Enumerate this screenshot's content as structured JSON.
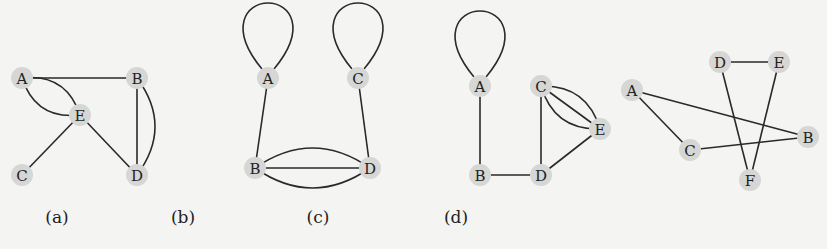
{
  "figure": {
    "panels": [
      {
        "id": "a",
        "caption": "(a)",
        "caption_pos": [
          57,
          217
        ],
        "nodes": [
          {
            "label": "A",
            "x": 22,
            "y": 78
          },
          {
            "label": "B",
            "x": 137,
            "y": 78
          },
          {
            "label": "E",
            "x": 80,
            "y": 115
          },
          {
            "label": "C",
            "x": 22,
            "y": 175
          },
          {
            "label": "D",
            "x": 137,
            "y": 175
          }
        ],
        "edges": [
          {
            "from": "A",
            "to": "B",
            "curve": 0
          },
          {
            "from": "A",
            "to": "E",
            "curve": 14
          },
          {
            "from": "A",
            "to": "E",
            "curve": -14
          },
          {
            "from": "B",
            "to": "D",
            "curve": 0
          },
          {
            "from": "B",
            "to": "D",
            "curve": -18
          },
          {
            "from": "E",
            "to": "C",
            "curve": 0
          },
          {
            "from": "E",
            "to": "D",
            "curve": 0
          }
        ]
      },
      {
        "id": "b",
        "caption": "(b)",
        "caption_pos": [
          183,
          217
        ],
        "nodes": [
          {
            "label": "A",
            "x": 268,
            "y": 78
          },
          {
            "label": "C",
            "x": 358,
            "y": 78
          },
          {
            "label": "B",
            "x": 255,
            "y": 168
          },
          {
            "label": "D",
            "x": 370,
            "y": 168
          }
        ],
        "edges": [
          {
            "from": "A",
            "to": "A",
            "loop": true
          },
          {
            "from": "C",
            "to": "C",
            "loop": true
          },
          {
            "from": "A",
            "to": "B",
            "curve": 0
          },
          {
            "from": "C",
            "to": "D",
            "curve": 0
          },
          {
            "from": "B",
            "to": "D",
            "curve": 0
          },
          {
            "from": "B",
            "to": "D",
            "curve": 20
          },
          {
            "from": "B",
            "to": "D",
            "curve": -20
          }
        ]
      },
      {
        "id": "c",
        "caption": "(c)",
        "caption_pos": [
          318,
          217
        ],
        "nodes": [
          {
            "label": "A",
            "x": 480,
            "y": 86
          },
          {
            "label": "C",
            "x": 541,
            "y": 86
          },
          {
            "label": "E",
            "x": 600,
            "y": 129
          },
          {
            "label": "B",
            "x": 480,
            "y": 175
          },
          {
            "label": "D",
            "x": 541,
            "y": 175
          }
        ],
        "edges": [
          {
            "from": "A",
            "to": "A",
            "loop": true
          },
          {
            "from": "A",
            "to": "B",
            "curve": 0
          },
          {
            "from": "B",
            "to": "D",
            "curve": 0
          },
          {
            "from": "C",
            "to": "D",
            "curve": 0
          },
          {
            "from": "D",
            "to": "E",
            "curve": 0
          },
          {
            "from": "C",
            "to": "E",
            "curve": 0
          },
          {
            "from": "C",
            "to": "E",
            "curve": 14
          },
          {
            "from": "C",
            "to": "E",
            "curve": -14
          }
        ]
      },
      {
        "id": "d",
        "caption": "(d)",
        "caption_pos": [
          456,
          217
        ],
        "nodes": [
          {
            "label": "D",
            "x": 720,
            "y": 62
          },
          {
            "label": "E",
            "x": 779,
            "y": 62
          },
          {
            "label": "A",
            "x": 632,
            "y": 90
          },
          {
            "label": "C",
            "x": 690,
            "y": 150
          },
          {
            "label": "B",
            "x": 808,
            "y": 137
          },
          {
            "label": "F",
            "x": 750,
            "y": 180
          }
        ],
        "edges": [
          {
            "from": "D",
            "to": "E",
            "curve": 0
          },
          {
            "from": "A",
            "to": "B",
            "curve": 0
          },
          {
            "from": "A",
            "to": "C",
            "curve": 0
          },
          {
            "from": "C",
            "to": "B",
            "curve": 0
          },
          {
            "from": "D",
            "to": "F",
            "curve": 0
          },
          {
            "from": "E",
            "to": "F",
            "curve": 0
          }
        ]
      }
    ]
  }
}
